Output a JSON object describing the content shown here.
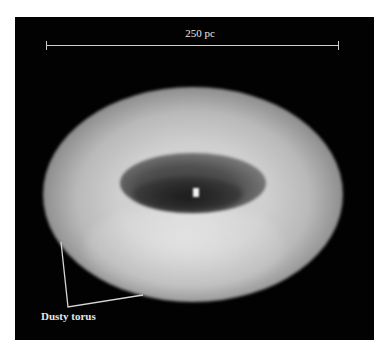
{
  "figure": {
    "scale_bar": {
      "label": "250 pc"
    },
    "annotation": {
      "label": "Dusty torus"
    },
    "colors": {
      "background": "#020202",
      "annotation": "#cfcfcf",
      "text": "#e8e8e8"
    }
  }
}
